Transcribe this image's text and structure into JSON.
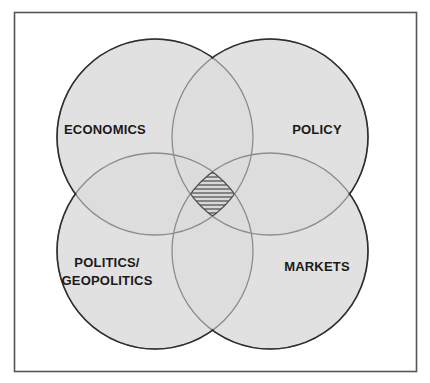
{
  "diagram": {
    "type": "venn",
    "frame": {
      "stroke": "#555555"
    },
    "fill_color": "#dcdcdc",
    "outer_stroke": "#2e2e2e",
    "inner_stroke": "#8c8c8c",
    "center_hatch_color": "#555555",
    "sets": [
      {
        "id": "economics",
        "label_lines": [
          "ECONOMICS"
        ],
        "cx": 155,
        "cy": 137,
        "r": 98,
        "label_x": 105,
        "label_y": [
          134
        ]
      },
      {
        "id": "policy",
        "label_lines": [
          "POLICY"
        ],
        "cx": 270,
        "cy": 137,
        "r": 98,
        "label_x": 317,
        "label_y": [
          134
        ]
      },
      {
        "id": "politics-geopolitics",
        "label_lines": [
          "POLITICS/",
          "GEOPOLITICS"
        ],
        "cx": 155,
        "cy": 251,
        "r": 98,
        "label_x": 107,
        "label_y": [
          267,
          285
        ]
      },
      {
        "id": "markets",
        "label_lines": [
          "MARKETS"
        ],
        "cx": 270,
        "cy": 251,
        "r": 98,
        "label_x": 317,
        "label_y": [
          271
        ]
      }
    ],
    "center_region": {
      "description": "hatched intersection of all four sets"
    }
  }
}
